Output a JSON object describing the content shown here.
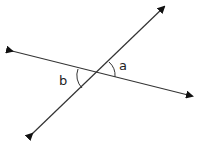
{
  "diagram": {
    "labels": {
      "angle_a": "a",
      "angle_b": "b"
    },
    "colors": {
      "line": "#333333",
      "background": "#ffffff"
    }
  }
}
